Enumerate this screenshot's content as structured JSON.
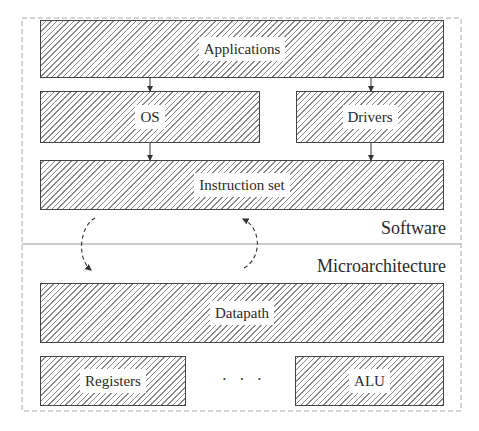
{
  "diagram": {
    "type": "layered-architecture",
    "hatching": "north-east lines",
    "colors": {
      "border": "#444444",
      "hatch": "#8a8a8a",
      "text": "#2a2a2a",
      "frame_dash": "#aaaaaa"
    },
    "layers": {
      "software": {
        "label": "Software",
        "boxes": [
          {
            "id": "applications",
            "label": "Applications"
          },
          {
            "id": "os",
            "label": "OS"
          },
          {
            "id": "drivers",
            "label": "Drivers"
          },
          {
            "id": "instruction_set",
            "label": "Instruction set"
          }
        ]
      },
      "microarchitecture": {
        "label": "Microarchitecture",
        "boxes": [
          {
            "id": "datapath",
            "label": "Datapath"
          },
          {
            "id": "registers",
            "label": "Registers"
          },
          {
            "id": "alu",
            "label": "ALU"
          }
        ],
        "ellipsis": "· · ·"
      }
    },
    "edges": [
      {
        "from": "applications",
        "to": "os",
        "style": "solid-arrow"
      },
      {
        "from": "applications",
        "to": "drivers",
        "style": "solid-arrow"
      },
      {
        "from": "os",
        "to": "instruction_set",
        "style": "solid-arrow"
      },
      {
        "from": "drivers",
        "to": "instruction_set",
        "style": "solid-arrow"
      },
      {
        "from": "instruction_set",
        "to": "datapath",
        "style": "dashed-curved-arrow"
      },
      {
        "from": "datapath",
        "to": "instruction_set",
        "style": "dashed-curved-arrow"
      }
    ]
  }
}
